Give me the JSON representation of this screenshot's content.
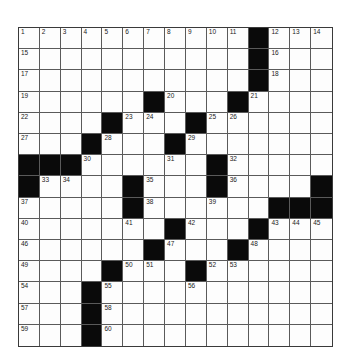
{
  "puzzle": {
    "rows": 15,
    "cols": 15,
    "blocks": [
      [
        0,
        11
      ],
      [
        1,
        11
      ],
      [
        2,
        11
      ],
      [
        3,
        6
      ],
      [
        3,
        10
      ],
      [
        4,
        4
      ],
      [
        4,
        8
      ],
      [
        5,
        3
      ],
      [
        5,
        7
      ],
      [
        6,
        0
      ],
      [
        6,
        1
      ],
      [
        6,
        2
      ],
      [
        6,
        9
      ],
      [
        7,
        0
      ],
      [
        7,
        5
      ],
      [
        7,
        9
      ],
      [
        7,
        14
      ],
      [
        8,
        5
      ],
      [
        8,
        12
      ],
      [
        8,
        13
      ],
      [
        8,
        14
      ],
      [
        9,
        7
      ],
      [
        9,
        11
      ],
      [
        10,
        6
      ],
      [
        10,
        10
      ],
      [
        11,
        4
      ],
      [
        11,
        8
      ],
      [
        12,
        3
      ],
      [
        13,
        3
      ],
      [
        14,
        3
      ]
    ],
    "numbers": [
      {
        "r": 0,
        "c": 0,
        "n": "1"
      },
      {
        "r": 0,
        "c": 1,
        "n": "2"
      },
      {
        "r": 0,
        "c": 2,
        "n": "3"
      },
      {
        "r": 0,
        "c": 3,
        "n": "4"
      },
      {
        "r": 0,
        "c": 4,
        "n": "5"
      },
      {
        "r": 0,
        "c": 5,
        "n": "6"
      },
      {
        "r": 0,
        "c": 6,
        "n": "7"
      },
      {
        "r": 0,
        "c": 7,
        "n": "8"
      },
      {
        "r": 0,
        "c": 8,
        "n": "9"
      },
      {
        "r": 0,
        "c": 9,
        "n": "10"
      },
      {
        "r": 0,
        "c": 10,
        "n": "11"
      },
      {
        "r": 0,
        "c": 12,
        "n": "12"
      },
      {
        "r": 0,
        "c": 13,
        "n": "13"
      },
      {
        "r": 0,
        "c": 14,
        "n": "14"
      },
      {
        "r": 1,
        "c": 0,
        "n": "15"
      },
      {
        "r": 1,
        "c": 12,
        "n": "16"
      },
      {
        "r": 2,
        "c": 0,
        "n": "17"
      },
      {
        "r": 2,
        "c": 12,
        "n": "18"
      },
      {
        "r": 3,
        "c": 0,
        "n": "19"
      },
      {
        "r": 3,
        "c": 7,
        "n": "20"
      },
      {
        "r": 3,
        "c": 11,
        "n": "21"
      },
      {
        "r": 4,
        "c": 0,
        "n": "22"
      },
      {
        "r": 4,
        "c": 5,
        "n": "23"
      },
      {
        "r": 4,
        "c": 6,
        "n": "24"
      },
      {
        "r": 4,
        "c": 9,
        "n": "25"
      },
      {
        "r": 4,
        "c": 10,
        "n": "26"
      },
      {
        "r": 5,
        "c": 0,
        "n": "27"
      },
      {
        "r": 5,
        "c": 4,
        "n": "28"
      },
      {
        "r": 5,
        "c": 8,
        "n": "29"
      },
      {
        "r": 6,
        "c": 3,
        "n": "30"
      },
      {
        "r": 6,
        "c": 7,
        "n": "31"
      },
      {
        "r": 6,
        "c": 10,
        "n": "32"
      },
      {
        "r": 7,
        "c": 1,
        "n": "33"
      },
      {
        "r": 7,
        "c": 2,
        "n": "34"
      },
      {
        "r": 7,
        "c": 6,
        "n": "35"
      },
      {
        "r": 7,
        "c": 10,
        "n": "36"
      },
      {
        "r": 8,
        "c": 0,
        "n": "37"
      },
      {
        "r": 8,
        "c": 6,
        "n": "38"
      },
      {
        "r": 8,
        "c": 9,
        "n": "39"
      },
      {
        "r": 9,
        "c": 0,
        "n": "40"
      },
      {
        "r": 9,
        "c": 5,
        "n": "41"
      },
      {
        "r": 9,
        "c": 8,
        "n": "42"
      },
      {
        "r": 9,
        "c": 12,
        "n": "43"
      },
      {
        "r": 9,
        "c": 13,
        "n": "44"
      },
      {
        "r": 9,
        "c": 14,
        "n": "45"
      },
      {
        "r": 10,
        "c": 0,
        "n": "46"
      },
      {
        "r": 10,
        "c": 7,
        "n": "47"
      },
      {
        "r": 10,
        "c": 11,
        "n": "48"
      },
      {
        "r": 11,
        "c": 0,
        "n": "49"
      },
      {
        "r": 11,
        "c": 5,
        "n": "50"
      },
      {
        "r": 11,
        "c": 6,
        "n": "51"
      },
      {
        "r": 11,
        "c": 9,
        "n": "52"
      },
      {
        "r": 11,
        "c": 10,
        "n": "53"
      },
      {
        "r": 12,
        "c": 0,
        "n": "54"
      },
      {
        "r": 12,
        "c": 4,
        "n": "55"
      },
      {
        "r": 12,
        "c": 8,
        "n": "56"
      },
      {
        "r": 13,
        "c": 0,
        "n": "57"
      },
      {
        "r": 13,
        "c": 4,
        "n": "58"
      },
      {
        "r": 14,
        "c": 0,
        "n": "59"
      },
      {
        "r": 14,
        "c": 4,
        "n": "60"
      }
    ],
    "colors": {
      "block": "#0a0a0a",
      "cell": "#fdfdfd",
      "line": "#5a5a5a",
      "number": "#222222"
    }
  }
}
